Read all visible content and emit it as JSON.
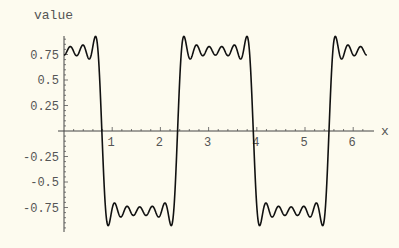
{
  "chart_data": {
    "type": "line",
    "title": "",
    "xlabel": "x",
    "ylabel": "value",
    "xlim": [
      0,
      6.2832
    ],
    "ylim": [
      -0.97,
      0.97
    ],
    "x_ticks": [
      1,
      2,
      3,
      4,
      5,
      6
    ],
    "x_tick_labels": [
      "1",
      "2",
      "3",
      "4",
      "5",
      "6"
    ],
    "y_ticks": [
      0.75,
      0.5,
      0.25,
      -0.25,
      -0.5,
      -0.75
    ],
    "y_tick_labels": [
      "0.75",
      "0.5",
      "0.25",
      "-0.25",
      "-0.5",
      "-0.75"
    ],
    "grid": false,
    "legend": null,
    "series": [
      {
        "name": "Fourier partial sum of square wave (6 odd harmonics of cos 2x)",
        "formula": "sum_{k=0}^{5} (-1)^k cos((2k+1)*2x)/(2k+1)",
        "harmonics": 6,
        "x_range": [
          0,
          6.2832
        ],
        "zero_crossings": [
          0.785,
          2.356,
          3.927,
          5.498
        ],
        "plateau_level": 0.785,
        "gibbs_peak": 0.93,
        "color": "#000000"
      }
    ]
  },
  "layout": {
    "origin_px": [
      64,
      131
    ],
    "px_per_x": 48.2,
    "px_per_y": 102,
    "x_axis_end_px": 374,
    "y_axis_top_px": 36,
    "y_axis_bottom_px": 232,
    "background": "#fdfbef"
  }
}
